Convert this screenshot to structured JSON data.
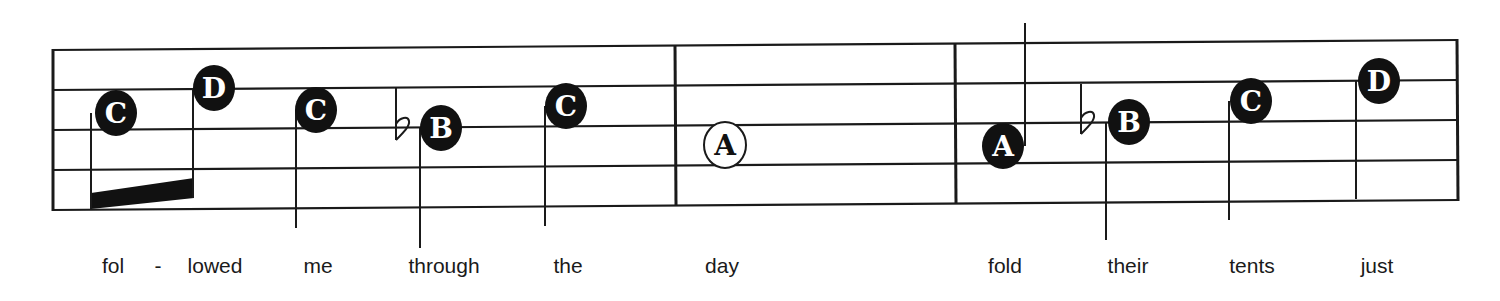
{
  "staff": {
    "line_color": "#1a1a1a",
    "measures": 3
  },
  "notes": [
    {
      "letter": "C",
      "type": "eighth",
      "filled": true,
      "x": 116,
      "y": 113,
      "stem": "down",
      "accidental": ""
    },
    {
      "letter": "D",
      "type": "eighth",
      "filled": true,
      "x": 214,
      "y": 88,
      "stem": "down",
      "accidental": ""
    },
    {
      "letter": "C",
      "type": "quarter",
      "filled": true,
      "x": 316,
      "y": 110,
      "stem": "down",
      "accidental": ""
    },
    {
      "letter": "B",
      "type": "quarter",
      "filled": true,
      "x": 441,
      "y": 128,
      "stem": "down",
      "accidental": "flat"
    },
    {
      "letter": "C",
      "type": "quarter",
      "filled": true,
      "x": 566,
      "y": 106,
      "stem": "down",
      "accidental": ""
    },
    {
      "letter": "A",
      "type": "half",
      "filled": false,
      "x": 725,
      "y": 145,
      "stem": "none",
      "accidental": ""
    },
    {
      "letter": "A",
      "type": "quarter",
      "filled": true,
      "x": 1003,
      "y": 146,
      "stem": "up",
      "accidental": ""
    },
    {
      "letter": "B",
      "type": "quarter",
      "filled": true,
      "x": 1129,
      "y": 122,
      "stem": "down",
      "accidental": "flat"
    },
    {
      "letter": "C",
      "type": "quarter",
      "filled": true,
      "x": 1251,
      "y": 101,
      "stem": "down",
      "accidental": ""
    },
    {
      "letter": "D",
      "type": "quarter",
      "filled": true,
      "x": 1379,
      "y": 81,
      "stem": "down",
      "accidental": ""
    }
  ],
  "lyrics": [
    {
      "text": "fol",
      "x": 113
    },
    {
      "text": "-",
      "x": 158
    },
    {
      "text": "lowed",
      "x": 215
    },
    {
      "text": "me",
      "x": 318
    },
    {
      "text": "through",
      "x": 444
    },
    {
      "text": "the",
      "x": 568
    },
    {
      "text": "day",
      "x": 722
    },
    {
      "text": "fold",
      "x": 1005
    },
    {
      "text": "their",
      "x": 1128
    },
    {
      "text": "tents",
      "x": 1252
    },
    {
      "text": "just",
      "x": 1377
    }
  ]
}
